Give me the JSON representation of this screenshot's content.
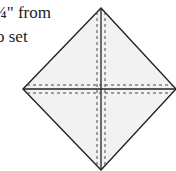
{
  "text": {
    "line1": "¼\" from",
    "line2": "o set"
  },
  "diagram": {
    "shape": "square rotated 45° (on-point)",
    "fill": "#f2f2f2",
    "stroke": "#222222",
    "vertices": {
      "top": [
        101,
        8
      ],
      "right": [
        176,
        89
      ],
      "bottom": [
        101,
        170
      ],
      "left": [
        23,
        89
      ]
    },
    "solid_lines": [
      "vertical center diagonal",
      "horizontal center diagonal"
    ],
    "dashed_lines": [
      "vertical offsets ±4px",
      "horizontal offsets ±4px"
    ]
  }
}
